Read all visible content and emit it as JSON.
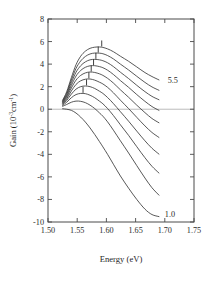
{
  "chart_data": {
    "type": "line",
    "title": "",
    "xlabel": "Energy (eV)",
    "ylabel": "Gain (10⁻³cm⁻¹)",
    "ylabel_parts": {
      "prefix": "Gain (10",
      "exp1": "-3",
      "mid": "cm",
      "exp2": "-1",
      "suffix": ")"
    },
    "xlim": [
      1.5,
      1.75
    ],
    "ylim": [
      -10,
      8
    ],
    "xticks": [
      1.5,
      1.55,
      1.6,
      1.65,
      1.7,
      1.75
    ],
    "xticklabels": [
      "1.50",
      "1.55",
      "1.60",
      "1.65",
      "1.70",
      "1.75"
    ],
    "yticks": [
      -10,
      -8,
      -6,
      -4,
      -2,
      0,
      2,
      4,
      6,
      8
    ],
    "yticklabels": [
      "-10",
      "-8",
      "-6",
      "-4",
      "-2",
      "0",
      "2",
      "4",
      "6",
      "8"
    ],
    "grid": false,
    "legend": "none",
    "zero_line": true,
    "annotations": [
      {
        "text": "5.5",
        "x": 1.705,
        "y": 2.6,
        "name": "curve-label-top"
      },
      {
        "text": "1.0",
        "x": 1.7,
        "y": -9.3,
        "name": "curve-label-bottom"
      }
    ],
    "series_labels": [
      "5.5",
      "5.0",
      "4.5",
      "4.0",
      "3.5",
      "3.0",
      "2.5",
      "2.0",
      "1.5",
      "1.0"
    ],
    "series": [
      {
        "name": "5.5",
        "x": [
          1.525,
          1.532,
          1.54,
          1.548,
          1.556,
          1.564,
          1.572,
          1.58,
          1.588,
          1.594,
          1.602,
          1.612,
          1.624,
          1.638,
          1.652,
          1.666,
          1.678,
          1.69
        ],
        "values": [
          0.8,
          1.55,
          2.8,
          3.95,
          4.7,
          5.15,
          5.4,
          5.5,
          5.52,
          5.48,
          5.35,
          5.1,
          4.7,
          4.25,
          3.75,
          3.25,
          2.9,
          2.6
        ],
        "peak_x": 1.592,
        "peak_y": 5.52,
        "peak_mark": true
      },
      {
        "name": "5.0",
        "x": [
          1.525,
          1.532,
          1.54,
          1.548,
          1.556,
          1.564,
          1.572,
          1.58,
          1.588,
          1.594,
          1.602,
          1.612,
          1.624,
          1.638,
          1.652,
          1.666,
          1.678,
          1.69
        ],
        "values": [
          0.72,
          1.42,
          2.58,
          3.62,
          4.28,
          4.68,
          4.9,
          4.98,
          4.97,
          4.92,
          4.76,
          4.46,
          4.0,
          3.48,
          2.92,
          2.38,
          1.98,
          1.68
        ],
        "peak_x": 1.586,
        "peak_y": 4.98,
        "peak_mark": true
      },
      {
        "name": "4.5",
        "x": [
          1.525,
          1.532,
          1.54,
          1.548,
          1.556,
          1.564,
          1.572,
          1.58,
          1.588,
          1.594,
          1.602,
          1.612,
          1.624,
          1.638,
          1.652,
          1.666,
          1.678,
          1.69
        ],
        "values": [
          0.66,
          1.3,
          2.36,
          3.28,
          3.86,
          4.2,
          4.38,
          4.42,
          4.38,
          4.3,
          4.12,
          3.78,
          3.28,
          2.72,
          2.12,
          1.56,
          1.14,
          0.84
        ],
        "peak_x": 1.582,
        "peak_y": 4.42,
        "peak_mark": true
      },
      {
        "name": "4.0",
        "x": [
          1.525,
          1.532,
          1.54,
          1.548,
          1.556,
          1.564,
          1.572,
          1.58,
          1.588,
          1.594,
          1.602,
          1.612,
          1.624,
          1.638,
          1.652,
          1.666,
          1.678,
          1.69
        ],
        "values": [
          0.6,
          1.18,
          2.12,
          2.94,
          3.44,
          3.72,
          3.85,
          3.86,
          3.78,
          3.68,
          3.46,
          3.08,
          2.54,
          1.94,
          1.3,
          0.7,
          0.24,
          -0.1
        ],
        "peak_x": 1.578,
        "peak_y": 3.86,
        "peak_mark": true
      },
      {
        "name": "3.5",
        "x": [
          1.525,
          1.532,
          1.54,
          1.548,
          1.556,
          1.564,
          1.572,
          1.58,
          1.588,
          1.594,
          1.602,
          1.612,
          1.624,
          1.638,
          1.652,
          1.666,
          1.678,
          1.69
        ],
        "values": [
          0.54,
          1.05,
          1.88,
          2.58,
          3.0,
          3.22,
          3.3,
          3.26,
          3.14,
          3.0,
          2.74,
          2.32,
          1.72,
          1.06,
          0.36,
          -0.3,
          -0.82,
          -1.2
        ],
        "peak_x": 1.574,
        "peak_y": 3.3,
        "peak_mark": true
      },
      {
        "name": "3.0",
        "x": [
          1.525,
          1.532,
          1.54,
          1.548,
          1.556,
          1.564,
          1.572,
          1.58,
          1.588,
          1.594,
          1.602,
          1.612,
          1.624,
          1.638,
          1.652,
          1.666,
          1.678,
          1.69
        ],
        "values": [
          0.48,
          0.92,
          1.62,
          2.2,
          2.52,
          2.66,
          2.68,
          2.58,
          2.4,
          2.24,
          1.94,
          1.46,
          0.8,
          0.06,
          -0.72,
          -1.48,
          -2.06,
          -2.5
        ],
        "peak_x": 1.57,
        "peak_y": 2.7,
        "peak_mark": true
      },
      {
        "name": "2.5",
        "x": [
          1.525,
          1.532,
          1.54,
          1.548,
          1.556,
          1.564,
          1.572,
          1.58,
          1.588,
          1.594,
          1.602,
          1.612,
          1.624,
          1.638,
          1.652,
          1.666,
          1.678,
          1.69
        ],
        "values": [
          0.42,
          0.78,
          1.34,
          1.78,
          2.0,
          2.06,
          2.0,
          1.84,
          1.6,
          1.4,
          1.04,
          0.5,
          -0.22,
          -1.06,
          -1.94,
          -2.8,
          -3.46,
          -3.98
        ],
        "peak_x": 1.566,
        "peak_y": 2.07,
        "peak_mark": true
      },
      {
        "name": "2.0",
        "x": [
          1.525,
          1.532,
          1.54,
          1.548,
          1.556,
          1.564,
          1.572,
          1.58,
          1.588,
          1.594,
          1.602,
          1.612,
          1.624,
          1.638,
          1.652,
          1.666,
          1.678,
          1.69
        ],
        "values": [
          0.34,
          0.62,
          1.02,
          1.3,
          1.4,
          1.38,
          1.24,
          1.02,
          0.72,
          0.48,
          0.06,
          -0.56,
          -1.38,
          -2.32,
          -3.32,
          -4.3,
          -5.06,
          -5.66
        ],
        "peak_x": 1.56,
        "peak_y": 1.41,
        "peak_mark": true
      },
      {
        "name": "1.5",
        "x": [
          1.525,
          1.532,
          1.54,
          1.548,
          1.556,
          1.564,
          1.572,
          1.58,
          1.588,
          1.594,
          1.602,
          1.612,
          1.624,
          1.638,
          1.652,
          1.666,
          1.678,
          1.69
        ],
        "values": [
          0.26,
          0.42,
          0.62,
          0.72,
          0.7,
          0.58,
          0.36,
          0.06,
          -0.32,
          -0.62,
          -1.12,
          -1.86,
          -2.8,
          -3.88,
          -5.0,
          -6.1,
          -6.96,
          -7.62
        ],
        "peak_x": 1.554,
        "peak_y": 0.73,
        "peak_mark": false
      },
      {
        "name": "1.0",
        "x": [
          1.525,
          1.532,
          1.54,
          1.548,
          1.556,
          1.564,
          1.572,
          1.58,
          1.588,
          1.594,
          1.602,
          1.612,
          1.624,
          1.638,
          1.652,
          1.666,
          1.678,
          1.69
        ],
        "values": [
          0.04,
          0.0,
          -0.1,
          -0.34,
          -0.7,
          -1.14,
          -1.66,
          -2.24,
          -2.86,
          -3.34,
          -4.0,
          -4.88,
          -5.92,
          -7.0,
          -8.0,
          -8.86,
          -9.34,
          -9.52
        ],
        "peak_x": null,
        "peak_y": null,
        "peak_mark": false
      }
    ]
  }
}
